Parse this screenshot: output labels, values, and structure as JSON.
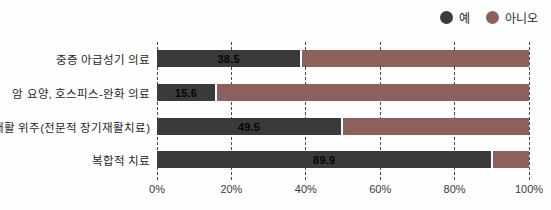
{
  "legend": {
    "items": [
      {
        "label": "예",
        "color": "#3a3a3a"
      },
      {
        "label": "아니오",
        "color": "#8d605b"
      }
    ]
  },
  "chart_data": {
    "type": "bar",
    "orientation": "horizontal",
    "stacked": true,
    "title": "",
    "xlabel": "",
    "ylabel": "",
    "xlim": [
      0,
      100
    ],
    "x_ticks": [
      "0%",
      "20%",
      "40%",
      "60%",
      "80%",
      "100%"
    ],
    "x_tick_values": [
      0,
      20,
      40,
      60,
      80,
      100
    ],
    "grid": "dashed-vertical",
    "legend_position": "top-right",
    "categories": [
      "중증 아급성기 의료",
      "암 요양, 호스피스-완화 의료",
      "재활 위주(전문적 장기재활치료)",
      "복합적 치료"
    ],
    "series": [
      {
        "name": "예",
        "color": "#3a3a3a",
        "values": [
          38.5,
          15.6,
          49.5,
          89.9
        ]
      },
      {
        "name": "아니오",
        "color": "#8d605b",
        "values": [
          61.5,
          84.4,
          50.5,
          10.1
        ]
      }
    ],
    "value_labels": [
      "38.5",
      "15.6",
      "49.5",
      "89.9"
    ]
  }
}
